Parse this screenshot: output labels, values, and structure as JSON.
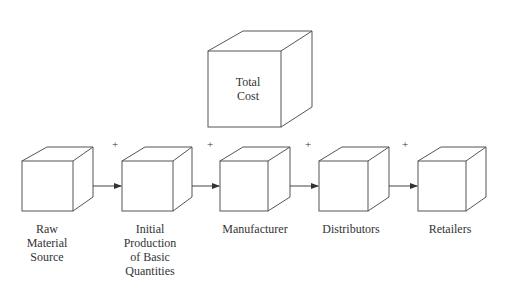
{
  "diagram": {
    "type": "supply-chain-flow",
    "total_cost": {
      "label": "Total\nCost"
    },
    "stages": [
      {
        "label": "Raw\nMaterial\nSource"
      },
      {
        "label": "Initial\nProduction\nof Basic\nQuantities"
      },
      {
        "label": "Manufacturer"
      },
      {
        "label": "Distributors"
      },
      {
        "label": "Retailers"
      }
    ],
    "connectors": [
      {
        "symbol": "+"
      },
      {
        "symbol": "+"
      },
      {
        "symbol": "+"
      },
      {
        "symbol": "+"
      }
    ],
    "colors": {
      "stroke": "#555555",
      "text": "#333333",
      "background": "#ffffff"
    }
  }
}
